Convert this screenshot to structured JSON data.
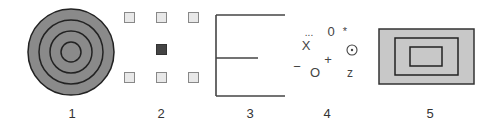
{
  "figures": [
    {
      "id": 1,
      "label": "1",
      "type": "concentric-circles",
      "center": [
        71,
        52
      ],
      "radii": [
        43,
        32,
        21,
        10
      ],
      "fill": "#8a8a8a",
      "stroke": "#222222"
    },
    {
      "id": 2,
      "label": "2",
      "type": "square-grid",
      "squares": [
        {
          "x": 124,
          "y": 12,
          "size": 11,
          "style": "light"
        },
        {
          "x": 156,
          "y": 12,
          "size": 11,
          "style": "light"
        },
        {
          "x": 188,
          "y": 12,
          "size": 11,
          "style": "light"
        },
        {
          "x": 156,
          "y": 44,
          "size": 11,
          "style": "dark"
        },
        {
          "x": 124,
          "y": 72,
          "size": 11,
          "style": "light"
        },
        {
          "x": 156,
          "y": 72,
          "size": 11,
          "style": "light"
        },
        {
          "x": 188,
          "y": 72,
          "size": 11,
          "style": "light"
        }
      ],
      "light_fill": "#e8e8e8",
      "light_stroke": "#888888",
      "dark_fill": "#444444"
    },
    {
      "id": 3,
      "label": "3",
      "type": "e-shape-lines",
      "stroke": "#444444"
    },
    {
      "id": 4,
      "label": "4",
      "type": "scattered-symbols",
      "symbols": [
        {
          "text": "...",
          "x": 309,
          "y": 33
        },
        {
          "text": "0",
          "x": 331,
          "y": 32
        },
        {
          "text": "*",
          "x": 345,
          "y": 30
        },
        {
          "text": "X",
          "x": 306,
          "y": 46
        },
        {
          "text": "⊙",
          "x": 352,
          "y": 50
        },
        {
          "text": "+",
          "x": 328,
          "y": 60
        },
        {
          "text": "−",
          "x": 297,
          "y": 67
        },
        {
          "text": "O",
          "x": 315,
          "y": 73
        },
        {
          "text": "z",
          "x": 350,
          "y": 73
        }
      ]
    },
    {
      "id": 5,
      "label": "5",
      "type": "nested-rectangles",
      "rects": [
        {
          "x": 379,
          "y": 29,
          "w": 95,
          "h": 55
        },
        {
          "x": 395,
          "y": 38,
          "w": 63,
          "h": 37
        },
        {
          "x": 410,
          "y": 47,
          "w": 32,
          "h": 19
        }
      ],
      "fill": "#c8c8c8",
      "stroke": "#333333"
    }
  ],
  "labels": {
    "fig1": "1",
    "fig2": "2",
    "fig3": "3",
    "fig4": "4",
    "fig5": "5"
  },
  "symbols": {
    "dots": "...",
    "zero": "0",
    "star": "*",
    "x": "X",
    "circled_dot": "⊙",
    "plus": "+",
    "minus": "−",
    "circle_o": "O",
    "z": "z"
  }
}
